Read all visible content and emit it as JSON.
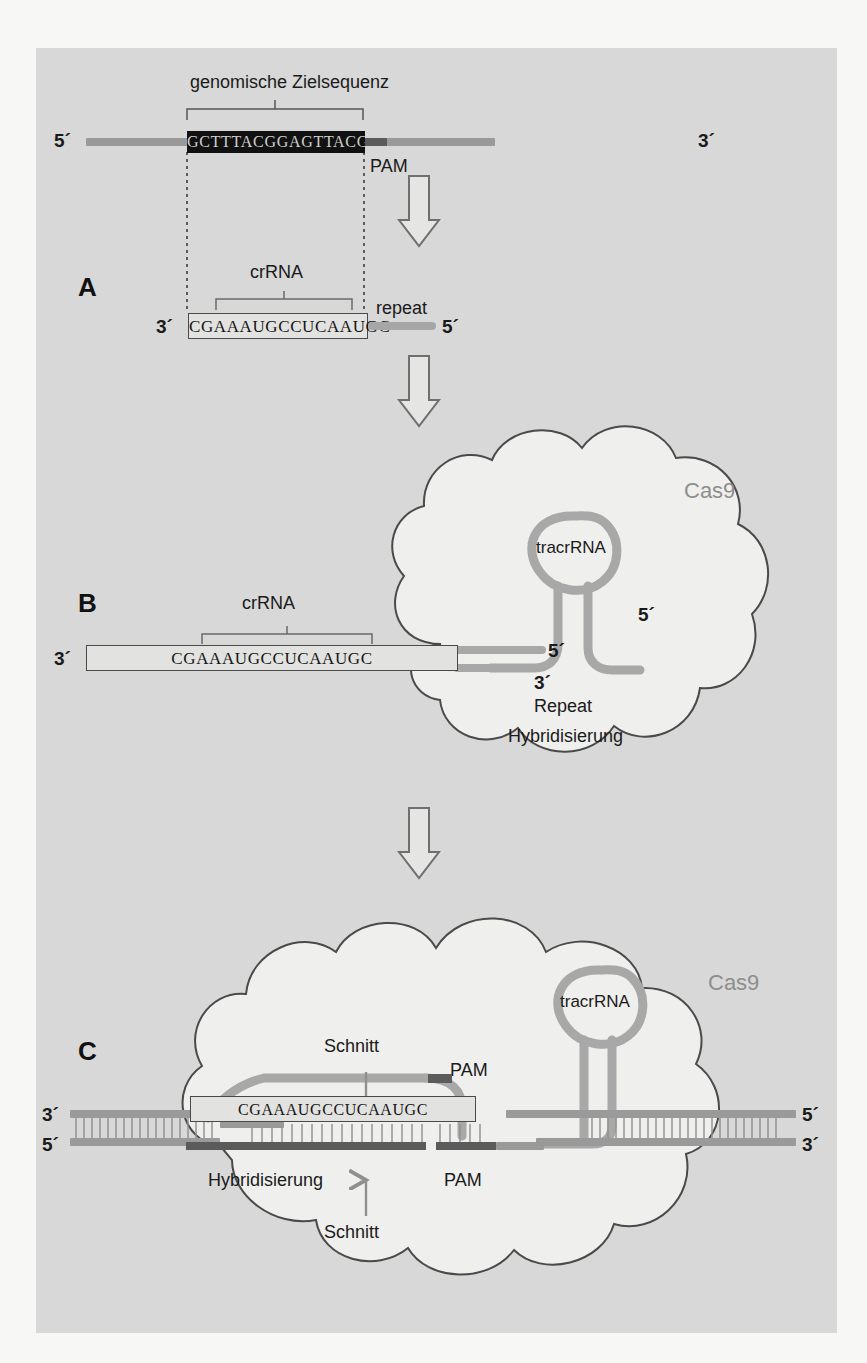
{
  "figure": {
    "title_sections": [
      "A",
      "B",
      "C"
    ],
    "background_color": "#d8d8d8",
    "page_color": "#f7f7f6"
  },
  "panel_a": {
    "letter": "A",
    "heading": "genomische Zielsequenz",
    "dna_sequence": "GCTTTACGGAGTTACG",
    "five_prime": "5´",
    "three_prime": "3´",
    "pam_label": "PAM",
    "crrna_label": "crRNA",
    "repeat_label": "repeat",
    "crrna_sequence": "CGAAAUGCCUCAAUGC",
    "crrna_three_prime": "3´",
    "crrna_five_prime": "5´"
  },
  "panel_b": {
    "letter": "B",
    "cas9_label": "Cas9",
    "tracrrna_label": "tracrRNA",
    "crrna_label": "crRNA",
    "crrna_sequence": "CGAAAUGCCUCAAUGC",
    "crrna_three_prime": "3´",
    "repeat_five_prime": "5´",
    "repeat_three_prime": "3´",
    "tracr_five_prime": "5´",
    "repeat_hybrid_line1": "Repeat",
    "repeat_hybrid_line2": "Hybridisierung"
  },
  "panel_c": {
    "letter": "C",
    "cas9_label": "Cas9",
    "tracrrna_label": "tracrRNA",
    "crrna_label": "crRNA",
    "crrna_sequence": "CGAAAUGCCUCAAUGC",
    "schnitt_top": "Schnitt",
    "schnitt_bottom": "Schnitt",
    "pam_top": "PAM",
    "pam_bottom": "PAM",
    "hybridisierung": "Hybridisierung",
    "left_three_prime": "3´",
    "left_five_prime": "5´",
    "right_five_prime": "5´",
    "right_three_prime": "3´"
  },
  "colors": {
    "strand_gray": "#9a9a9a",
    "strand_dark": "#5b5b5b",
    "dna_box_black": "#111111",
    "cas9_outline": "#4a4a4a",
    "cas9_fill": "#eeeeec",
    "text": "#1a1a1a"
  }
}
